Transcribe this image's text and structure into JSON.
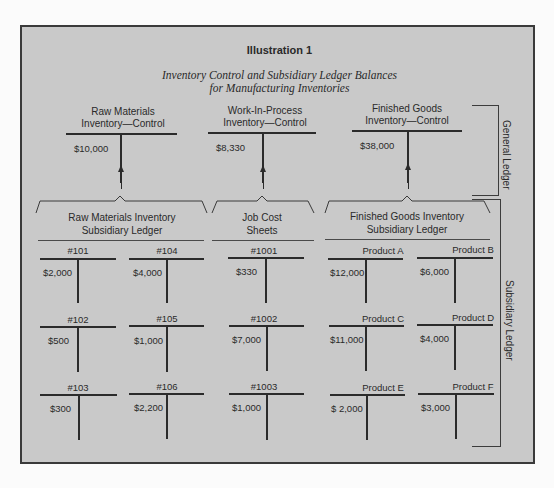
{
  "title": "Illustration 1",
  "subtitle": {
    "line1": "Inventory Control and Subsidiary Ledger Balances",
    "line2": "for Manufacturing Inventories"
  },
  "general_ledger": {
    "label": "General Ledger",
    "accounts": [
      {
        "name_line1": "Raw Materials",
        "name_line2": "Inventory—Control",
        "balance": "$10,000"
      },
      {
        "name_line1": "Work-In-Process",
        "name_line2": "Inventory—Control",
        "balance": "$8,330"
      },
      {
        "name_line1": "Finished Goods",
        "name_line2": "Inventory—Control",
        "balance": "$38,000"
      }
    ]
  },
  "subsidiary_ledger": {
    "label": "Subsidiary Ledger",
    "groups": [
      {
        "label_line1": "Raw Materials Inventory",
        "label_line2": "Subsidiary Ledger"
      },
      {
        "label_line1": "Job Cost",
        "label_line2": "Sheets"
      },
      {
        "label_line1": "Finished Goods Inventory",
        "label_line2": "Subsidiary Ledger"
      }
    ],
    "accounts": [
      {
        "name": "#101",
        "balance": "$2,000"
      },
      {
        "name": "#104",
        "balance": "$4,000"
      },
      {
        "name": "#1001",
        "balance": "$330"
      },
      {
        "name": "Product A",
        "balance": "$12,000"
      },
      {
        "name": "Product B",
        "balance": "$6,000"
      },
      {
        "name": "#102",
        "balance": "$500"
      },
      {
        "name": "#105",
        "balance": "$1,000"
      },
      {
        "name": "#1002",
        "balance": "$7,000"
      },
      {
        "name": "Product C",
        "balance": "$11,000"
      },
      {
        "name": "Product D",
        "balance": "$4,000"
      },
      {
        "name": "#103",
        "balance": "$300"
      },
      {
        "name": "#106",
        "balance": "$2,200"
      },
      {
        "name": "#1003",
        "balance": "$1,000"
      },
      {
        "name": "Product E",
        "balance": "$ 2,000"
      },
      {
        "name": "Product F",
        "balance": "$3,000"
      }
    ]
  },
  "colors": {
    "panel_background": "#c9c9c9",
    "line": "#2b2b2b",
    "page_background": "#fbfbfb"
  }
}
